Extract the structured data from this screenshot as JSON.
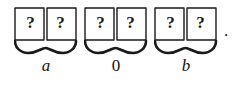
{
  "figure": {
    "type": "math-notation-diagram",
    "cell_symbol": "?",
    "trailing_punctuation": ".",
    "ink_color": "#1a1a1a",
    "background_color": "#ffffff",
    "groups": [
      {
        "id": "group-a",
        "label": "a",
        "label_style": "italic",
        "cells": [
          "?",
          "?"
        ]
      },
      {
        "id": "group-0",
        "label": "0",
        "label_style": "upright",
        "cells": [
          "?",
          "?"
        ]
      },
      {
        "id": "group-b",
        "label": "b",
        "label_style": "italic",
        "cells": [
          "?",
          "?"
        ]
      }
    ]
  }
}
